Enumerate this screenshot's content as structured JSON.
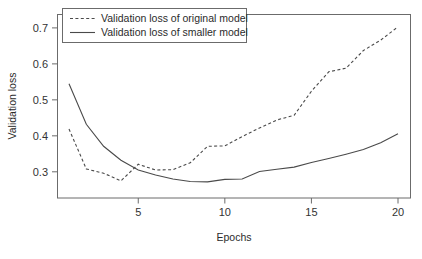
{
  "chart_data": {
    "type": "line",
    "title": "",
    "xlabel": "Epochs",
    "ylabel": "Validation loss",
    "xlim": [
      1,
      20
    ],
    "ylim": [
      0.255,
      0.715
    ],
    "grid": false,
    "legend_position": "top-left",
    "xticks": [
      5,
      10,
      15,
      20
    ],
    "xtick_labels": [
      "5",
      "10",
      "15",
      "20"
    ],
    "yticks": [
      0.3,
      0.4,
      0.5,
      0.6,
      0.7
    ],
    "ytick_labels": [
      "0.3",
      "0.4",
      "0.5",
      "0.6",
      "0.7"
    ],
    "x": [
      1,
      2,
      3,
      4,
      5,
      6,
      7,
      8,
      9,
      10,
      11,
      12,
      13,
      14,
      15,
      16,
      17,
      18,
      19,
      20
    ],
    "series": [
      {
        "name": "Validation loss of original model",
        "style": "dashed",
        "color": "#4a4a4a",
        "values": [
          0.419,
          0.308,
          0.296,
          0.275,
          0.321,
          0.305,
          0.306,
          0.325,
          0.371,
          0.372,
          0.398,
          0.422,
          0.444,
          0.457,
          0.524,
          0.578,
          0.588,
          0.637,
          0.666,
          0.703
        ]
      },
      {
        "name": "Validation loss of smaller model",
        "style": "solid",
        "color": "#4a4a4a",
        "values": [
          0.545,
          0.432,
          0.371,
          0.332,
          0.305,
          0.291,
          0.28,
          0.273,
          0.272,
          0.279,
          0.28,
          0.301,
          0.307,
          0.313,
          0.326,
          0.337,
          0.349,
          0.362,
          0.381,
          0.406
        ]
      }
    ],
    "legend": [
      {
        "label": "Validation loss of original model",
        "style": "dashed"
      },
      {
        "label": "Validation loss of smaller model",
        "style": "solid"
      }
    ]
  },
  "figure": {
    "background": "#ffffff",
    "axis_color": "#6b6b6b",
    "line_color": "#4a4a4a"
  }
}
